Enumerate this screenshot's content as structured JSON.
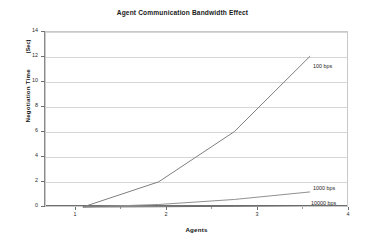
{
  "chart_data": {
    "type": "line",
    "title": "Agent Communication Bandwidth Effect",
    "xlabel": "Agents",
    "ylabel": "Negotiation Time",
    "ylabel_units": "(Sec)",
    "x": [
      1,
      2,
      3,
      4
    ],
    "xtick_labels": [
      "1",
      "2",
      "3",
      "4"
    ],
    "ytick_labels": [
      "0",
      "2",
      "4",
      "6",
      "8",
      "10",
      "12",
      "14"
    ],
    "ylim": [
      0,
      14
    ],
    "xlim": [
      0.5,
      4.5
    ],
    "grid": "horizontal",
    "legend_position": "inline-right",
    "series": [
      {
        "name": "100 bps",
        "values": [
          0,
          2,
          6,
          12
        ],
        "color": "#808080"
      },
      {
        "name": "1000 bps",
        "values": [
          0,
          0.2,
          0.6,
          1.2
        ],
        "color": "#909090"
      },
      {
        "name": "10000 bps",
        "values": [
          0,
          0.02,
          0.06,
          0.12
        ],
        "color": "#6a6a6a"
      }
    ]
  },
  "chart": {
    "title": "Agent Communication Bandwidth Effect",
    "x_axis_title": "Agents",
    "y_axis_title": "Negotiation Time",
    "y_axis_units": "(Sec)",
    "y_ticks": [
      "14",
      "12",
      "10",
      "8",
      "6",
      "4",
      "2",
      "0"
    ],
    "x_ticks": [
      "1",
      "2",
      "3",
      "4"
    ],
    "series_labels": {
      "s100": "100 bps",
      "s1000": "1000 bps",
      "s10000": "10000 bps"
    },
    "colors": {
      "plot_border": "#c9c9c9",
      "gridline": "#d6d6d6",
      "axis": "#6f6f6f",
      "series_100": "#808080",
      "series_1000": "#909090",
      "series_10000": "#6a6a6a",
      "background": "#ffffff"
    }
  }
}
